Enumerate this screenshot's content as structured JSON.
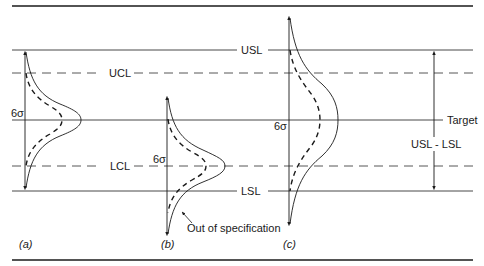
{
  "diagram": {
    "line_labels": {
      "usl": "USL",
      "ucl": "UCL",
      "target": "Target",
      "lcl": "LCL",
      "lsl": "LSL"
    },
    "range_label": "USL - LSL",
    "sigma_label": "6σ",
    "annotation": "Out of specification",
    "panels": [
      {
        "id": "a",
        "caption": "(a)",
        "sigma": "6σ",
        "center": "Target"
      },
      {
        "id": "b",
        "caption": "(b)",
        "sigma": "6σ",
        "center": "LCL"
      },
      {
        "id": "c",
        "caption": "(c)",
        "sigma": "6σ",
        "center": "Target"
      }
    ],
    "colors": {
      "line": "#1a1a1a",
      "background": "#ffffff"
    }
  }
}
